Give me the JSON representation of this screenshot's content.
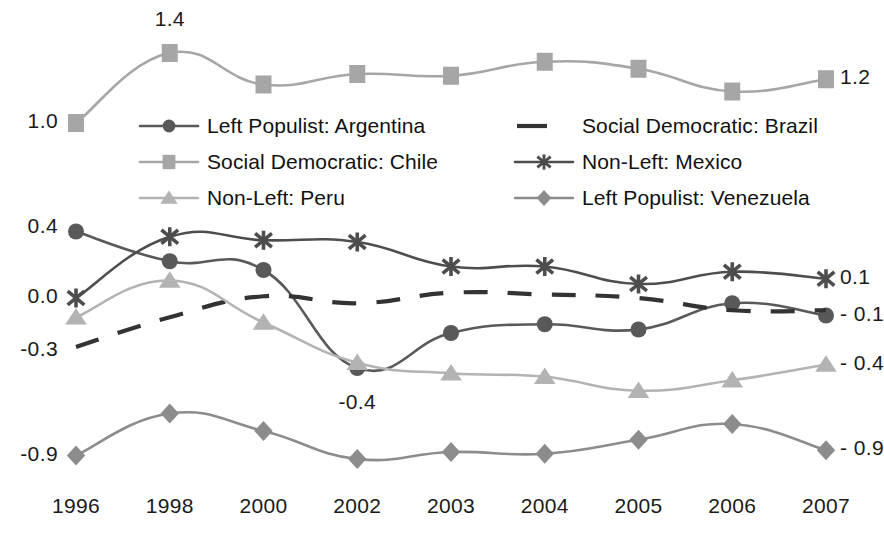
{
  "chart_data": {
    "type": "line",
    "title": "",
    "xlabel": "",
    "ylabel": "",
    "categories": [
      "1996",
      "1998",
      "2000",
      "2002",
      "2003",
      "2004",
      "2005",
      "2006",
      "2007"
    ],
    "ylim": [
      -1.05,
      1.55
    ],
    "grid": false,
    "legend_position": "inside-upper-left",
    "y_axis_left_ticks": [
      "1.0",
      "0.4",
      "0.0",
      "-0.3",
      "-0.9"
    ],
    "y_axis_right_ticks": [
      "1.2",
      "0.1",
      "- 0.1",
      "- 0.4",
      "- 0.9"
    ],
    "annotations": [
      {
        "text": "1.4",
        "series": "Social Democratic: Chile",
        "category": "1998",
        "value": 1.4
      },
      {
        "text": "-0.4",
        "series": "Left Populist: Argentina",
        "category": "2002",
        "value": -0.4
      }
    ],
    "series": [
      {
        "name": "Left Populist: Argentina",
        "marker": "circle",
        "dash": false,
        "color": "#595959",
        "values": [
          0.38,
          0.21,
          0.16,
          -0.4,
          -0.2,
          -0.15,
          -0.18,
          -0.03,
          -0.1
        ]
      },
      {
        "name": "Social Democratic: Brazil",
        "marker": "none",
        "dash": true,
        "color": "#333333",
        "values": [
          -0.28,
          -0.11,
          0.01,
          -0.03,
          0.03,
          0.02,
          0.0,
          -0.07,
          -0.07
        ]
      },
      {
        "name": "Social Democratic: Chile",
        "marker": "square",
        "dash": false,
        "color": "#a6a6a6",
        "values": [
          1.0,
          1.4,
          1.22,
          1.28,
          1.27,
          1.35,
          1.31,
          1.18,
          1.25
        ]
      },
      {
        "name": "Non-Left: Mexico",
        "marker": "asterisk",
        "dash": false,
        "color": "#4d4d4d",
        "values": [
          0.0,
          0.35,
          0.33,
          0.32,
          0.18,
          0.18,
          0.08,
          0.15,
          0.11
        ]
      },
      {
        "name": "Non-Left: Peru",
        "marker": "triangle",
        "dash": false,
        "color": "#b3b3b3",
        "values": [
          -0.11,
          0.1,
          -0.14,
          -0.37,
          -0.43,
          -0.45,
          -0.53,
          -0.47,
          -0.38
        ]
      },
      {
        "name": "Left Populist: Venezuela",
        "marker": "diamond",
        "dash": false,
        "color": "#8c8c8c",
        "values": [
          -0.9,
          -0.66,
          -0.76,
          -0.92,
          -0.88,
          -0.89,
          -0.81,
          -0.72,
          -0.87
        ]
      }
    ]
  },
  "legend": {
    "items": [
      {
        "label": "Left Populist: Argentina",
        "marker": "circle",
        "dash": false,
        "color": "#595959"
      },
      {
        "label": "Social Democratic: Brazil",
        "marker": "none",
        "dash": true,
        "color": "#333333"
      },
      {
        "label": "Social Democratic: Chile",
        "marker": "square",
        "dash": false,
        "color": "#a6a6a6"
      },
      {
        "label": "Non-Left: Mexico",
        "marker": "asterisk",
        "dash": false,
        "color": "#4d4d4d"
      },
      {
        "label": "Non-Left: Peru",
        "marker": "triangle",
        "dash": false,
        "color": "#b3b3b3"
      },
      {
        "label": "Left Populist: Venezuela",
        "marker": "diamond",
        "dash": false,
        "color": "#8c8c8c"
      }
    ]
  },
  "axis_labels": {
    "left": [
      {
        "text": "1.0",
        "value": 1.0
      },
      {
        "text": "0.4",
        "value": 0.4
      },
      {
        "text": "0.0",
        "value": 0.0
      },
      {
        "text": "-0.3",
        "value": -0.3
      },
      {
        "text": "-0.9",
        "value": -0.9
      }
    ],
    "right": [
      {
        "text": "1.2",
        "value": 1.25
      },
      {
        "text": "0.1",
        "value": 0.11
      },
      {
        "text": "- 0.1",
        "value": -0.1
      },
      {
        "text": "- 0.4",
        "value": -0.38
      },
      {
        "text": "- 0.9",
        "value": -0.87
      }
    ]
  }
}
